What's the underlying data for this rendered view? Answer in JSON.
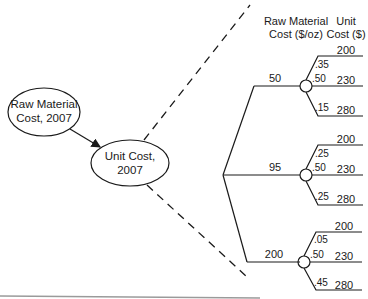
{
  "influence_diagram": {
    "source_node": {
      "line1": "Raw Material",
      "line2": "Cost, 2007"
    },
    "target_node": {
      "line1": "Unit Cost,",
      "line2": "2007"
    }
  },
  "tree": {
    "headers": {
      "raw_material": {
        "line1": "Raw Material",
        "line2": "Cost ($/oz)"
      },
      "unit_cost": {
        "line1": "Unit",
        "line2": "Cost ($)"
      }
    },
    "branches": [
      {
        "raw_material_cost": "50",
        "outcomes": [
          {
            "probability": ".35",
            "unit_cost": "200"
          },
          {
            "probability": ".50",
            "unit_cost": "230"
          },
          {
            "probability": ".15",
            "unit_cost": "280"
          }
        ]
      },
      {
        "raw_material_cost": "95",
        "outcomes": [
          {
            "probability": ".25",
            "unit_cost": "200"
          },
          {
            "probability": ".50",
            "unit_cost": "230"
          },
          {
            "probability": ".25",
            "unit_cost": "280"
          }
        ]
      },
      {
        "raw_material_cost": "200",
        "outcomes": [
          {
            "probability": ".05",
            "unit_cost": "200"
          },
          {
            "probability": ".50",
            "unit_cost": "230"
          },
          {
            "probability": ".45",
            "unit_cost": "280"
          }
        ]
      }
    ]
  }
}
